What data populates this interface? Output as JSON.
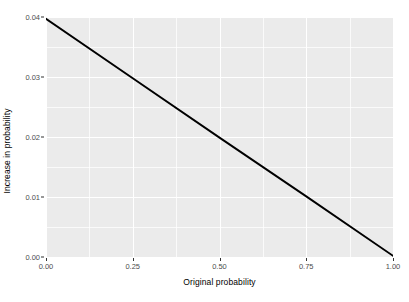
{
  "chart_data": {
    "type": "line",
    "title": "",
    "xlabel": "Original probability",
    "ylabel": "Increase in probability",
    "xlim": [
      0.0,
      1.0
    ],
    "ylim": [
      0.0,
      0.04
    ],
    "grid": true,
    "legend": "none",
    "x_ticks": [
      "0.00",
      "0.25",
      "0.50",
      "0.75",
      "1.00"
    ],
    "x_tick_values": [
      0.0,
      0.25,
      0.5,
      0.75,
      1.0
    ],
    "y_ticks": [
      "0.00",
      "0.01",
      "0.02",
      "0.03",
      "0.04"
    ],
    "y_tick_values": [
      0.0,
      0.01,
      0.02,
      0.03,
      0.04
    ],
    "x_minor_values": [
      0.125,
      0.375,
      0.625,
      0.875
    ],
    "y_minor_values": [
      0.005,
      0.015,
      0.025,
      0.035
    ],
    "series": [
      {
        "name": "Increase in probability",
        "color": "#000000",
        "line_width": 1.9,
        "x": [
          0.0,
          0.25,
          0.5,
          0.75,
          1.0
        ],
        "values": [
          0.0397,
          0.0298,
          0.0199,
          0.0101,
          0.0002
        ]
      }
    ],
    "panel_background": "#ebebeb",
    "gridline_color": "#ffffff",
    "tick_label_color": "#4d4d4d",
    "axis_title_color": "#000000"
  },
  "axis": {
    "x_title": "Original probability",
    "y_title": "Increase in probability",
    "x_tick_labels": [
      "0.00",
      "0.25",
      "0.50",
      "0.75",
      "1.00"
    ],
    "y_tick_labels": [
      "0.00",
      "0.01",
      "0.02",
      "0.03",
      "0.04"
    ]
  }
}
